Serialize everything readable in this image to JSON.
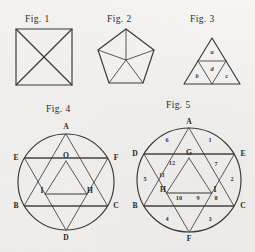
{
  "plate": {
    "background_color": "#f1f0ee",
    "ink_color": "#3a3734"
  },
  "figures": [
    {
      "caption": "Fig. 1",
      "shape": "square-with-diagonals",
      "labels": []
    },
    {
      "caption": "Fig. 2",
      "shape": "pentagon-with-radii",
      "labels": []
    },
    {
      "caption": "Fig. 3",
      "shape": "triangle-subdivided-into-four",
      "labels": [
        {
          "text": "a",
          "region": "top"
        },
        {
          "text": "d",
          "region": "center-inverted"
        },
        {
          "text": "b",
          "region": "bottom-left"
        },
        {
          "text": "c",
          "region": "bottom-right"
        }
      ]
    },
    {
      "caption": "Fig. 4",
      "shape": "hexagram-in-circle",
      "labels": [
        {
          "text": "A",
          "position": "top-vertex"
        },
        {
          "text": "E",
          "position": "upper-left-vertex"
        },
        {
          "text": "F",
          "position": "upper-right-vertex"
        },
        {
          "text": "O",
          "position": "center"
        },
        {
          "text": "I",
          "position": "inner-left"
        },
        {
          "text": "H",
          "position": "inner-right"
        },
        {
          "text": "B",
          "position": "lower-left-vertex"
        },
        {
          "text": "C",
          "position": "lower-right-vertex"
        },
        {
          "text": "D",
          "position": "bottom-vertex"
        }
      ]
    },
    {
      "caption": "Fig. 5",
      "shape": "hexagram-in-circle-numbered",
      "labels": [
        {
          "text": "A",
          "position": "top-vertex"
        },
        {
          "text": "D",
          "position": "upper-left-vertex"
        },
        {
          "text": "E",
          "position": "upper-right-vertex"
        },
        {
          "text": "G",
          "position": "center"
        },
        {
          "text": "H",
          "position": "inner-left"
        },
        {
          "text": "I",
          "position": "inner-right"
        },
        {
          "text": "B",
          "position": "lower-left-vertex"
        },
        {
          "text": "C",
          "position": "lower-right-vertex"
        },
        {
          "text": "F",
          "position": "bottom-vertex"
        }
      ],
      "region_numbers": [
        {
          "text": "1",
          "region": "upper-right-arc"
        },
        {
          "text": "2",
          "region": "right-arc"
        },
        {
          "text": "3",
          "region": "lower-right-arc"
        },
        {
          "text": "4",
          "region": "lower-left-arc"
        },
        {
          "text": "5",
          "region": "left-arc"
        },
        {
          "text": "6",
          "region": "upper-left-arc"
        },
        {
          "text": "7",
          "region": "inner-upper-right"
        },
        {
          "text": "8",
          "region": "inner-lower-right"
        },
        {
          "text": "9",
          "region": "inner-bottom-right"
        },
        {
          "text": "10",
          "region": "inner-bottom-left"
        },
        {
          "text": "11",
          "region": "inner-lower-left"
        },
        {
          "text": "12",
          "region": "inner-upper-left"
        }
      ]
    }
  ]
}
